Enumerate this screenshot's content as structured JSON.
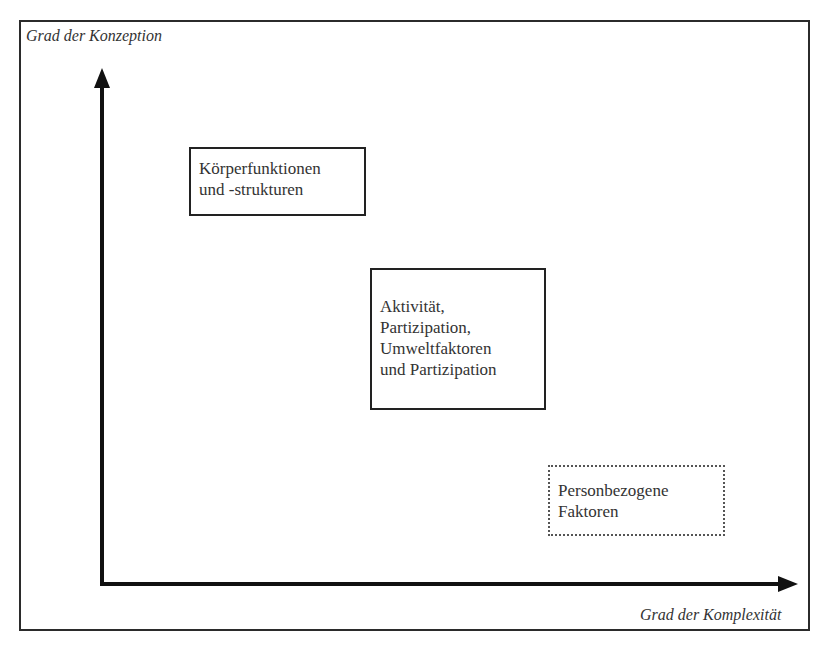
{
  "diagram": {
    "y_axis_label": "Grad der Konzeption",
    "x_axis_label": "Grad der Komplexität",
    "boxes": [
      {
        "id": "koerperfunktionen",
        "border": "solid",
        "lines": [
          "Körperfunktionen",
          "und -strukturen"
        ]
      },
      {
        "id": "aktivitaet",
        "border": "solid",
        "lines": [
          "Aktivität,",
          "Partizipation,",
          "Umweltfaktoren",
          "und Partizipation"
        ]
      },
      {
        "id": "personbezogene",
        "border": "dotted",
        "lines": [
          "Personbezogene",
          "Faktoren"
        ]
      }
    ]
  }
}
